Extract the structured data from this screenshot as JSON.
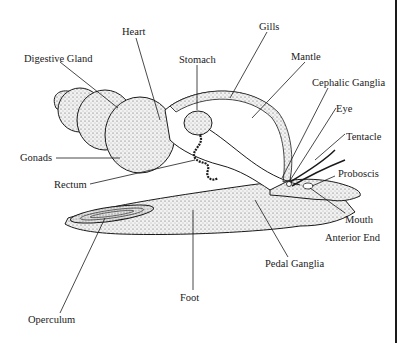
{
  "labels": {
    "digestive_gland": "Digestive Gland",
    "heart": "Heart",
    "stomach": "Stomach",
    "gills": "Gills",
    "mantle": "Mantle",
    "cephalic_ganglia": "Cephalic Ganglia",
    "eye": "Eye",
    "tentacle": "Tentacle",
    "proboscis": "Proboscis",
    "mouth": "Mouth",
    "anterior_end": "Anterior End",
    "gonads": "Gonads",
    "rectum": "Rectum",
    "pedal_ganglia": "Pedal Ganglia",
    "foot": "Foot",
    "operculum": "Operculum"
  },
  "colors": {
    "ink": "#1a1a1a",
    "stipple": "#d8d8d8",
    "background": "#ffffff"
  }
}
